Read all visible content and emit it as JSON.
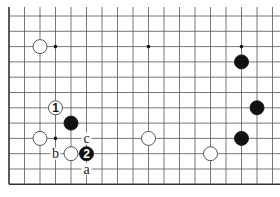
{
  "diagram": {
    "type": "go-board-partial",
    "grid": {
      "x0": 9,
      "y0": 16,
      "spacing_x": 15.5,
      "spacing_y": 15.3,
      "cols": 18,
      "rows": 11,
      "top_open": true,
      "line_color": "#555555",
      "edge_color": "#333333"
    },
    "hoshi": [
      [
        3,
        2
      ],
      [
        9,
        2
      ],
      [
        15,
        2
      ],
      [
        3,
        8
      ]
    ],
    "stones": [
      {
        "col": 2,
        "row": 2,
        "color": "white",
        "label": ""
      },
      {
        "col": 15,
        "row": 3,
        "color": "black",
        "label": ""
      },
      {
        "col": 3,
        "row": 6,
        "color": "white",
        "label": "1"
      },
      {
        "col": 4,
        "row": 7,
        "color": "black",
        "label": ""
      },
      {
        "col": 16,
        "row": 6,
        "color": "black",
        "label": ""
      },
      {
        "col": 2,
        "row": 8,
        "color": "white",
        "label": ""
      },
      {
        "col": 9,
        "row": 8,
        "color": "white",
        "label": ""
      },
      {
        "col": 15,
        "row": 8,
        "color": "black",
        "label": ""
      },
      {
        "col": 4,
        "row": 9,
        "color": "white",
        "label": ""
      },
      {
        "col": 5,
        "row": 9,
        "color": "black",
        "label": "2"
      },
      {
        "col": 13,
        "row": 9,
        "color": "white",
        "label": ""
      }
    ],
    "letters": [
      {
        "col": 5,
        "row": 8,
        "text": "c"
      },
      {
        "col": 3,
        "row": 9,
        "text": "b"
      },
      {
        "col": 5,
        "row": 10,
        "text": "a"
      }
    ]
  }
}
